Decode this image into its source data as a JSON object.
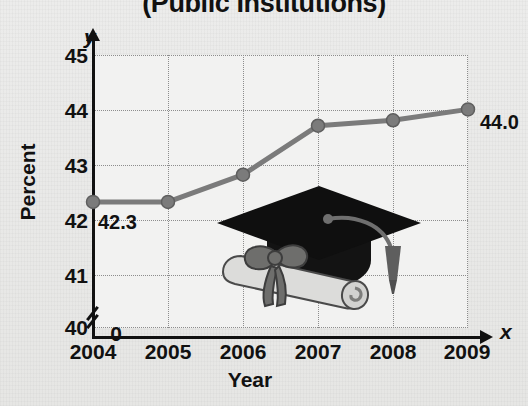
{
  "title": "(Public Institutions)",
  "axes": {
    "y_label": "Percent",
    "x_label": "Year",
    "y_axis_tag": "y",
    "x_axis_tag": "x",
    "y_ticks": [
      "45",
      "44",
      "43",
      "42",
      "41",
      "40",
      "0"
    ],
    "x_ticks": [
      "2004",
      "2005",
      "2006",
      "2007",
      "2008",
      "2009"
    ]
  },
  "annotations": {
    "first_point_label": "42.3",
    "last_point_label": "44.0"
  },
  "colors": {
    "line": "#7b7b7b",
    "marker": "#7b7b7b",
    "grid": "#8d8d8d",
    "axis": "#111111",
    "plot_background": "#f2f2f1",
    "page_background": "#e8e8e6",
    "cap": "#111111",
    "diploma": "#d8d8d6",
    "ribbon": "#8a8a88"
  },
  "illustration": {
    "name": "graduation-cap-and-diploma"
  },
  "chart_data": {
    "type": "line",
    "title": "(Public Institutions)",
    "xlabel": "Year",
    "ylabel": "Percent",
    "categories": [
      "2004",
      "2005",
      "2006",
      "2007",
      "2008",
      "2009"
    ],
    "values": [
      42.3,
      42.3,
      42.8,
      43.7,
      43.8,
      44.0
    ],
    "point_labels": [
      "42.3",
      "",
      "",
      "",
      "",
      "44.0"
    ],
    "ylim": [
      40,
      45
    ],
    "yticks": [
      40,
      41,
      42,
      43,
      44,
      45
    ],
    "y_axis_break": true,
    "y_axis_break_between": [
      0,
      40
    ],
    "grid": true,
    "grid_style": "dotted",
    "legend": false
  }
}
